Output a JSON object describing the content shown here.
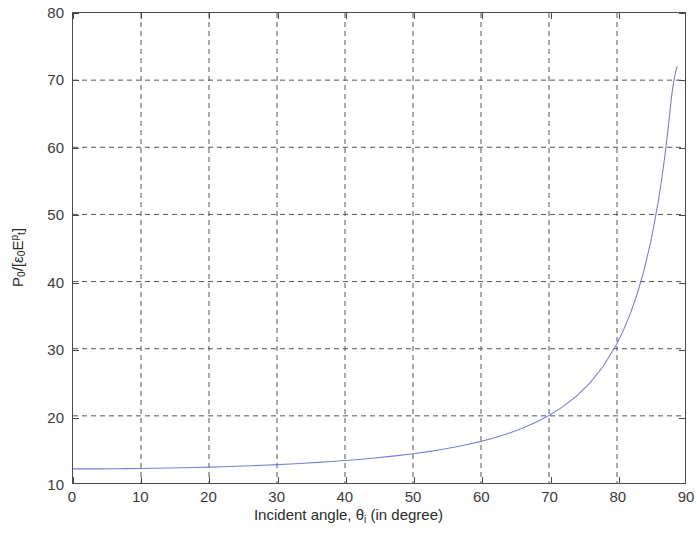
{
  "chart_data": {
    "type": "line",
    "title": "",
    "xlabel": "Incident angle, θi (in degree)",
    "ylabel": "P0/[ε0Et^p]",
    "xlim": [
      0,
      90
    ],
    "ylim": [
      10,
      80
    ],
    "xticks": [
      0,
      10,
      20,
      30,
      40,
      50,
      60,
      70,
      80,
      90
    ],
    "yticks": [
      10,
      20,
      30,
      40,
      50,
      60,
      70,
      80
    ],
    "xtick_labels": [
      "0",
      "10",
      "20",
      "30",
      "40",
      "50",
      "60",
      "70",
      "80",
      "90"
    ],
    "ytick_labels": [
      "10",
      "20",
      "30",
      "40",
      "50",
      "60",
      "70",
      "80"
    ],
    "grid": true,
    "grid_style": "dashed",
    "legend": null,
    "series": [
      {
        "name": "P0 normalized power",
        "color": "#7b7fd4",
        "line_width": 1.1,
        "x": [
          0,
          2,
          4,
          6,
          8,
          10,
          12,
          14,
          16,
          18,
          20,
          22,
          24,
          26,
          28,
          30,
          32,
          34,
          36,
          38,
          40,
          42,
          44,
          46,
          48,
          50,
          52,
          54,
          56,
          58,
          60,
          62,
          64,
          66,
          68,
          70,
          72,
          74,
          76,
          78,
          80,
          81,
          82,
          83,
          84,
          85,
          86,
          86.5,
          87,
          87.5,
          88,
          88.3,
          88.6,
          88.8,
          88.9
        ],
        "y": [
          12.1,
          12.1,
          12.11,
          12.12,
          12.14,
          12.16,
          12.19,
          12.23,
          12.27,
          12.32,
          12.37,
          12.43,
          12.5,
          12.57,
          12.65,
          12.74,
          12.84,
          12.95,
          13.07,
          13.2,
          13.35,
          13.51,
          13.69,
          13.89,
          14.11,
          14.36,
          14.64,
          14.96,
          15.32,
          15.73,
          16.2,
          16.75,
          17.38,
          18.12,
          19.0,
          20.05,
          21.33,
          22.9,
          24.88,
          27.42,
          30.78,
          32.88,
          35.34,
          38.26,
          41.78,
          46.1,
          51.5,
          54.72,
          58.4,
          62.6,
          67.4,
          69.6,
          71.2,
          71.9,
          72.0
        ]
      }
    ]
  },
  "axes": {
    "x_tick_labels": [
      "0",
      "10",
      "20",
      "30",
      "40",
      "50",
      "60",
      "70",
      "80",
      "90"
    ],
    "y_tick_labels": [
      "10",
      "20",
      "30",
      "40",
      "50",
      "60",
      "70",
      "80"
    ]
  },
  "labels": {
    "x_axis_title_prefix": "Incident angle, ",
    "x_axis_theta": "θ",
    "x_axis_theta_sub": "i",
    "x_axis_title_suffix": " (in degree)",
    "y_axis_P": "P",
    "y_axis_P_sub": "0",
    "y_axis_slash_bracket": "/[",
    "y_axis_eps": "ε",
    "y_axis_eps_sub": "0",
    "y_axis_E": "E",
    "y_axis_E_sub": "t",
    "y_axis_E_sup": "p",
    "y_axis_close_bracket": "]"
  },
  "colors": {
    "curve": "#7b7fd4",
    "axis": "#4a4a4a",
    "grid": "#555555",
    "text": "#2c2c2c",
    "background": "#ffffff"
  }
}
